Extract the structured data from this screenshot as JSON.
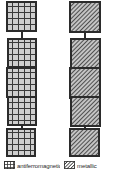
{
  "figure": {
    "background_color": "#ffffff",
    "ink_color": "#2b2b2b",
    "width": 128,
    "height": 172
  },
  "chains": [
    {
      "id": "left-chain",
      "name": "grid-hatch-chain",
      "pattern": "cross-hatch-grid",
      "pattern_fill": "#c8c8c8",
      "pattern_line": "#3a3a3a",
      "node_count": 5,
      "center_x": 22,
      "node_size": 29,
      "nodes": [
        {
          "index": 1,
          "x": 7,
          "y": 2,
          "size": 29
        },
        {
          "index": 2,
          "x": 8,
          "y": 39,
          "size": 28
        },
        {
          "index": 3,
          "x": 7,
          "y": 68,
          "size": 29
        },
        {
          "index": 4,
          "x": 8,
          "y": 97,
          "size": 28
        },
        {
          "index": 5,
          "x": 7,
          "y": 129,
          "size": 27
        }
      ],
      "connectors": [
        {
          "from": 1,
          "to": 2,
          "x": 22,
          "y1": 31,
          "y2": 39
        },
        {
          "from": 2,
          "to": 3,
          "x": 22,
          "y1": 67,
          "y2": 68
        },
        {
          "from": 3,
          "to": 4,
          "x": 22,
          "y1": 97,
          "y2": 97
        },
        {
          "from": 4,
          "to": 5,
          "x": 22,
          "y1": 125,
          "y2": 129
        }
      ]
    },
    {
      "id": "right-chain",
      "name": "diagonal-hatch-chain",
      "pattern": "diagonal-hatch",
      "pattern_fill": "#bdbdbd",
      "pattern_line": "#4a4a4a",
      "node_count": 5,
      "center_x": 85,
      "node_size": 30,
      "nodes": [
        {
          "index": 1,
          "x": 70,
          "y": 2,
          "size": 30
        },
        {
          "index": 2,
          "x": 71,
          "y": 39,
          "size": 29
        },
        {
          "index": 3,
          "x": 70,
          "y": 68,
          "size": 30
        },
        {
          "index": 4,
          "x": 71,
          "y": 97,
          "size": 29
        },
        {
          "index": 5,
          "x": 70,
          "y": 129,
          "size": 28
        }
      ],
      "connectors": [
        {
          "from": 1,
          "to": 2,
          "x": 85,
          "y1": 32,
          "y2": 39
        },
        {
          "from": 2,
          "to": 3,
          "x": 85,
          "y1": 68,
          "y2": 68
        },
        {
          "from": 3,
          "to": 4,
          "x": 85,
          "y1": 98,
          "y2": 97
        },
        {
          "from": 4,
          "to": 5,
          "x": 85,
          "y1": 126,
          "y2": 129
        }
      ]
    }
  ],
  "legend": {
    "entries": [
      {
        "id": "legend-grid",
        "swatch": "cross-hatch-grid-swatch",
        "label": "antiferromagnetic"
      },
      {
        "id": "legend-diagonal",
        "swatch": "diagonal-hatch-swatch",
        "label": "metallic"
      }
    ]
  }
}
